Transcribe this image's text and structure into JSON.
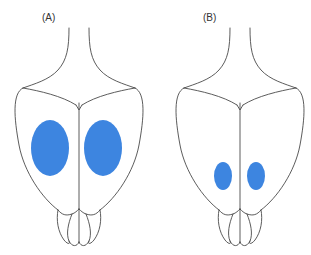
{
  "figure": {
    "title": "",
    "background_color": "#ffffff",
    "width": 311,
    "height": 255,
    "outline_color": "#4a4a4a",
    "lesion_color": "#3d85e0"
  },
  "panels": [
    {
      "id": "A",
      "label": "(A)",
      "label_x": 42,
      "label_y": 21,
      "subject": "rat-brain-dorsal-view",
      "lesions": [
        {
          "side": "left",
          "cx": 50,
          "cy": 148,
          "rx": 19,
          "ry": 28
        },
        {
          "side": "right",
          "cx": 103,
          "cy": 148,
          "rx": 19,
          "ry": 28
        }
      ]
    },
    {
      "id": "B",
      "label": "(B)",
      "label_x": 203,
      "label_y": 21,
      "subject": "rat-brain-dorsal-view",
      "lesions": [
        {
          "side": "left",
          "cx": 223,
          "cy": 176,
          "rx": 9,
          "ry": 14
        },
        {
          "side": "right",
          "cx": 256,
          "cy": 176,
          "rx": 9,
          "ry": 14
        }
      ]
    }
  ],
  "legend": {
    "lesion_meaning": "",
    "entries": []
  }
}
